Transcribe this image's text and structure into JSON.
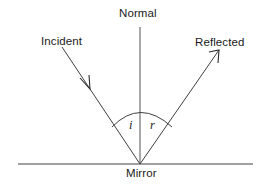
{
  "diagram": {
    "type": "ray-diagram",
    "background_color": "#ffffff",
    "stroke_color": "#404040",
    "text_color": "#1a1a1a",
    "labels": {
      "normal": "Normal",
      "incident": "Incident",
      "reflected": "Reflected",
      "mirror": "Mirror",
      "angle_incidence": "i",
      "angle_reflection": "r"
    },
    "geometry": {
      "incidence_point": {
        "x": 140,
        "y": 164
      },
      "normal_line": {
        "x1": 140,
        "y1": 27,
        "x2": 140,
        "y2": 164
      },
      "mirror_line": {
        "x1": 18,
        "y1": 164,
        "x2": 253,
        "y2": 164
      },
      "incident_ray": {
        "x1": 62,
        "y1": 47,
        "x2": 140,
        "y2": 164
      },
      "incident_arrow_tip": {
        "x": 90,
        "y": 89
      },
      "reflected_ray": {
        "x1": 140,
        "y1": 164,
        "x2": 219,
        "y2": 50
      },
      "reflected_arrow_tip": {
        "x": 219,
        "y": 50
      },
      "angle_arc": {
        "start_x": 112,
        "start_y": 127,
        "apex_x": 140,
        "apex_y": 106,
        "end_x": 172,
        "end_y": 127
      }
    }
  }
}
